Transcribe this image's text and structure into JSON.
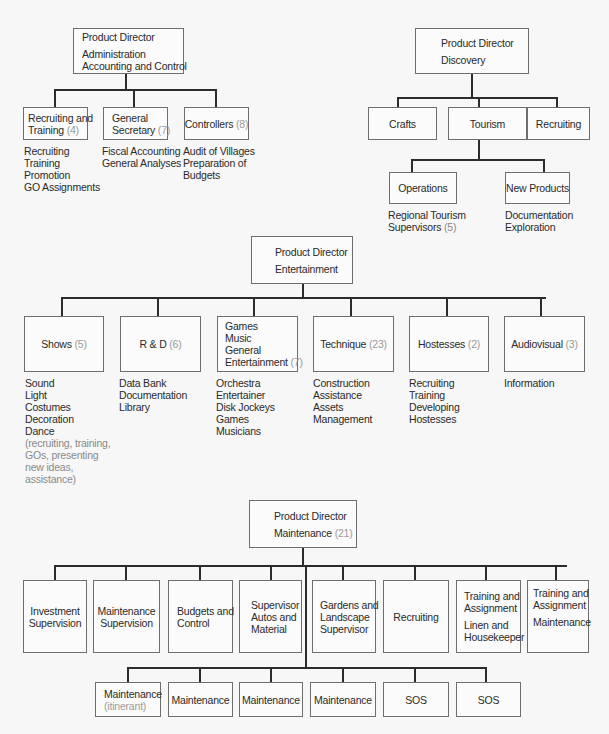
{
  "admin": {
    "director": {
      "title": "Product Director",
      "lines": [
        "Administration",
        "Accounting and Control"
      ]
    },
    "children": [
      {
        "label_lines": [
          "Recruiting and",
          "Training"
        ],
        "count": "(4)",
        "duties": [
          "Recruiting",
          "Training",
          "Promotion",
          "GO Assignments"
        ]
      },
      {
        "label_lines": [
          "General",
          "Secretary"
        ],
        "count": "(7)",
        "duties": [
          "Fiscal Accounting",
          "General Analyses"
        ]
      },
      {
        "label_lines": [
          "Controllers"
        ],
        "count": "(8)",
        "duties": [
          "Audit of Villages",
          "Preparation of",
          "Budgets"
        ]
      }
    ]
  },
  "discovery": {
    "director": {
      "title": "Product Director",
      "lines": [
        "Discovery"
      ]
    },
    "children": [
      {
        "label": "Crafts"
      },
      {
        "label": "Tourism"
      },
      {
        "label": "Recruiting"
      }
    ],
    "tourism_children": [
      {
        "label": "Operations",
        "duties": [
          "Regional Tourism",
          "Supervisors"
        ],
        "count": "(5)"
      },
      {
        "label": "New Products",
        "duties": [
          "Documentation",
          "Exploration"
        ]
      }
    ]
  },
  "entertainment": {
    "director": {
      "title": "Product Director",
      "lines": [
        "Entertainment"
      ]
    },
    "children": [
      {
        "label": "Shows",
        "count": "(5)",
        "duties": [
          "Sound",
          "Light",
          "Costumes",
          "Decoration",
          "Dance"
        ],
        "note": [
          "(recruiting, training,",
          "GOs, presenting",
          "new ideas,",
          "assistance)"
        ]
      },
      {
        "label": "R & D",
        "count": "(6)",
        "duties": [
          "Data Bank",
          "Documentation",
          "Library"
        ]
      },
      {
        "label_lines": [
          "Games",
          "Music",
          "General",
          "Entertainment"
        ],
        "count": "(7)",
        "duties": [
          "Orchestra",
          "Entertainer",
          "Disk Jockeys",
          "Games",
          "Musicians"
        ]
      },
      {
        "label": "Technique",
        "count": "(23)",
        "duties": [
          "Construction",
          "Assistance",
          "Assets",
          "Management"
        ]
      },
      {
        "label": "Hostesses",
        "count": "(2)",
        "duties": [
          "Recruiting",
          "Training",
          "Developing",
          "Hostesses"
        ]
      },
      {
        "label": "Audiovisual",
        "count": "(3)",
        "duties": [
          "Information"
        ]
      }
    ]
  },
  "maintenance": {
    "director": {
      "title": "Product Director",
      "line": "Maintenance",
      "count": "(21)"
    },
    "children": [
      {
        "lines": [
          "Investment",
          "Supervision"
        ]
      },
      {
        "lines": [
          "Maintenance",
          "Supervision"
        ]
      },
      {
        "lines": [
          "Budgets and",
          "Control"
        ]
      },
      {
        "lines": [
          "Supervisor",
          "Autos and",
          "Material"
        ]
      },
      {
        "lines": [
          "Gardens and",
          "Landscape",
          "Supervisor"
        ]
      },
      {
        "lines": [
          "Recruiting"
        ]
      },
      {
        "lines": [
          "Training and",
          "Assignment"
        ],
        "sub": [
          "Linen and",
          "Housekeeper"
        ]
      },
      {
        "lines": [
          "Training and",
          "Assignment"
        ],
        "sub": [
          "Maintenance"
        ]
      }
    ],
    "units": [
      {
        "label": "Maintenance",
        "note": "(itinerant)"
      },
      {
        "label": "Maintenance"
      },
      {
        "label": "Maintenance"
      },
      {
        "label": "Maintenance"
      },
      {
        "label": "SOS"
      },
      {
        "label": "SOS"
      }
    ]
  }
}
